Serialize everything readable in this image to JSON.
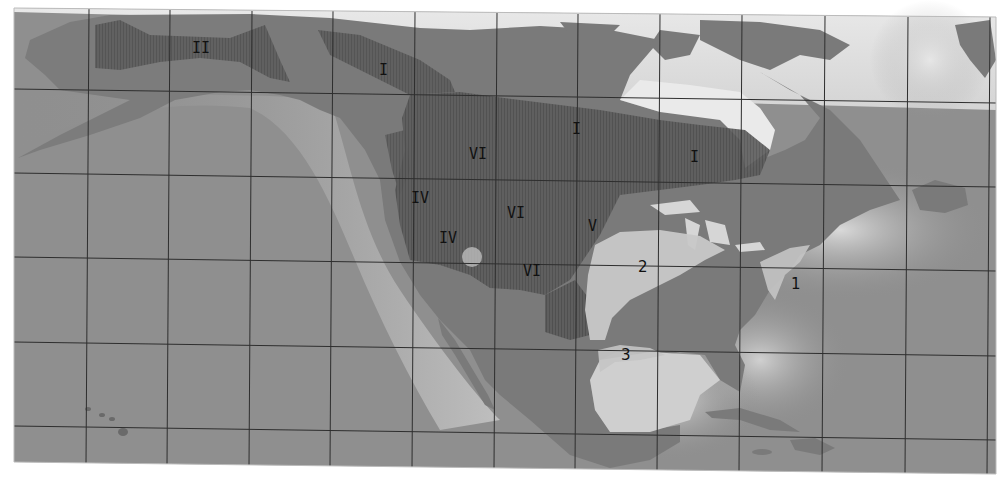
{
  "map": {
    "subject": "North America",
    "style": "grayscale relief map with graticule grid",
    "colors": {
      "ocean": "#8f8f8f",
      "ocean_coastal_glow": "#e8e8e8",
      "land": "#7a7a7a",
      "land_light": "#9a9a9a",
      "region_dark": "#5a5a5a",
      "region_light": "#c8c8c8",
      "grid": "#2e2e2e",
      "label": "#111111"
    },
    "regions_roman": [
      {
        "id": "I",
        "label": "I",
        "x": 577,
        "y": 130
      },
      {
        "id": "I-east",
        "label": "I",
        "x": 695,
        "y": 158
      },
      {
        "id": "II",
        "label": "II",
        "x": 387,
        "y": 70
      },
      {
        "id": "III",
        "label": "III",
        "x": 204,
        "y": 48
      },
      {
        "id": "IV-north",
        "label": "IV",
        "x": 421,
        "y": 199
      },
      {
        "id": "IV-south",
        "label": "IV",
        "x": 449,
        "y": 239
      },
      {
        "id": "V",
        "label": "V",
        "x": 593,
        "y": 227
      },
      {
        "id": "VI-north",
        "label": "VI",
        "x": 479,
        "y": 155
      },
      {
        "id": "VI-central",
        "label": "VI",
        "x": 517,
        "y": 214
      },
      {
        "id": "VI-south",
        "label": "VI",
        "x": 533,
        "y": 272
      }
    ],
    "regions_numeric": [
      {
        "id": "1",
        "label": "1",
        "x": 795,
        "y": 285
      },
      {
        "id": "2",
        "label": "2",
        "x": 643,
        "y": 268
      },
      {
        "id": "3",
        "label": "3",
        "x": 626,
        "y": 356
      }
    ]
  }
}
